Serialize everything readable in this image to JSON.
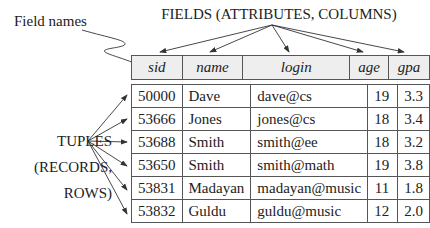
{
  "labels": {
    "fields_title": "FIELDS (ATTRIBUTES, COLUMNS)",
    "field_names": "Field names",
    "tuples_lines": [
      "TUPLES",
      "(RECORDS,",
      "ROWS)"
    ]
  },
  "table": {
    "columns": [
      "sid",
      "name",
      "login",
      "age",
      "gpa"
    ],
    "rows": [
      [
        "50000",
        "Dave",
        "dave@cs",
        "19",
        "3.3"
      ],
      [
        "53666",
        "Jones",
        "jones@cs",
        "18",
        "3.4"
      ],
      [
        "53688",
        "Smith",
        "smith@ee",
        "18",
        "3.2"
      ],
      [
        "53650",
        "Smith",
        "smith@math",
        "19",
        "3.8"
      ],
      [
        "53831",
        "Madayan",
        "madayan@music",
        "11",
        "1.8"
      ],
      [
        "53832",
        "Guldu",
        "guldu@music",
        "12",
        "2.0"
      ]
    ]
  },
  "colors": {
    "header_bg": "#eeeeee",
    "border": "#555555",
    "text": "#222222"
  }
}
